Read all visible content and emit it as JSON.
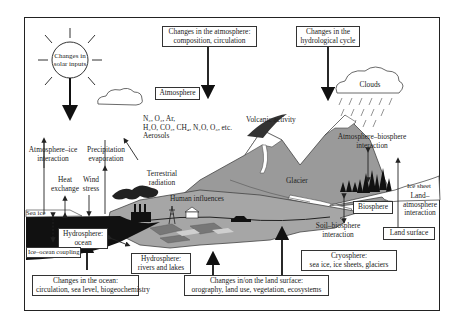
{
  "sun": {
    "label_line1": "Changes in",
    "label_line2": "solar inputs"
  },
  "top_boxes": {
    "atmosphere_change": {
      "line1": "Changes in the atmosphere:",
      "line2": "composition, circulation"
    },
    "hydrological_change": {
      "line1": "Changes in the",
      "line2": "hydrological cycle"
    }
  },
  "atmosphere_box": "Atmosphere",
  "clouds": "Clouds",
  "gases": {
    "line1": "N₂, O₂, Ar,",
    "line2": "H₂O, CO₂, CH₄, N₂O, O₃, etc.",
    "line3": "Aerosols"
  },
  "volcanic": "Volcanic activity",
  "terrestrial": {
    "line1": "Terrestrial",
    "line2": "radiation"
  },
  "atm_ice": {
    "line1": "Atmosphere–ice",
    "line2": "interaction"
  },
  "precip": {
    "line1": "Precipitation",
    "line2": "evaporation"
  },
  "heat": {
    "line1": "Heat",
    "line2": "exchange"
  },
  "wind": {
    "line1": "Wind",
    "line2": "stress"
  },
  "glacier": "Glacier",
  "human": "Human influences",
  "atm_bio": {
    "line1": "Atmosphere–biosphere",
    "line2": "interaction"
  },
  "ice_sheet": "Ice sheet",
  "biosphere_box": "Biosphere",
  "land_atm": {
    "line1": "Land–",
    "line2": "atmosphere",
    "line3": "interaction"
  },
  "soil_bio": {
    "line1": "Soil–biosphere",
    "line2": "interaction"
  },
  "land_surface_box": "Land surface",
  "sea_ice": "Sea ice",
  "hydro_ocean": {
    "line1": "Hydrosphere:",
    "line2": "ocean"
  },
  "ice_ocean": "Ice–ocean coupling",
  "hydro_rivers": {
    "line1": "Hydrosphere:",
    "line2": "rivers and lakes"
  },
  "cryosphere": {
    "line1": "Cryosphere:",
    "line2": "sea ice, ice sheets, glaciers"
  },
  "bottom_boxes": {
    "ocean_change": {
      "line1": "Changes in the ocean:",
      "line2": "circulation, sea level, biogeochemistry"
    },
    "land_change": {
      "line1": "Changes in/on the land surface:",
      "line2": "orography, land use, vegetation, ecosystems"
    }
  },
  "colors": {
    "mountain": "#9a9a9a",
    "ocean": "#111111",
    "land": "#a6a6a6",
    "snow": "#ffffff"
  }
}
